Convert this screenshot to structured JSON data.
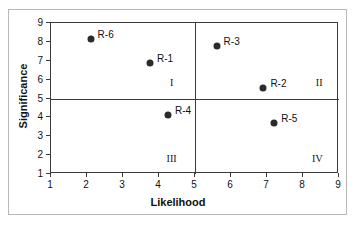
{
  "chart_data": {
    "type": "scatter",
    "title": "",
    "xlabel": "Likelihood",
    "ylabel": "Significance",
    "xlim": [
      1,
      9
    ],
    "ylim": [
      1,
      9
    ],
    "xticks": [
      1,
      2,
      3,
      4,
      5,
      6,
      7,
      8,
      9
    ],
    "yticks": [
      1,
      2,
      3,
      4,
      5,
      6,
      7,
      8,
      9
    ],
    "grid": false,
    "legend": "none",
    "point_color": "#2b2b2b",
    "axis_color": "#3a3a3a",
    "frame_color": "#b9b9b9",
    "dividers": {
      "vertical_x": 5,
      "horizontal_y": 5
    },
    "points": [
      {
        "label": "R-6",
        "x": 2.1,
        "y": 8.15
      },
      {
        "label": "R-1",
        "x": 3.75,
        "y": 6.9
      },
      {
        "label": "R-3",
        "x": 5.6,
        "y": 7.8
      },
      {
        "label": "R-2",
        "x": 6.9,
        "y": 5.55
      },
      {
        "label": "R-4",
        "x": 4.25,
        "y": 4.1
      },
      {
        "label": "R-5",
        "x": 7.2,
        "y": 3.7
      }
    ],
    "quadrants": [
      {
        "label": "I",
        "x": 4.35,
        "y": 5.85
      },
      {
        "label": "II",
        "x": 8.45,
        "y": 5.85
      },
      {
        "label": "III",
        "x": 4.35,
        "y": 1.85
      },
      {
        "label": "IV",
        "x": 8.4,
        "y": 1.85
      }
    ]
  }
}
